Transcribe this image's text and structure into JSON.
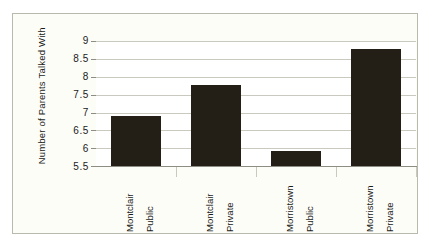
{
  "figure": {
    "background_color": "#ffffff",
    "frame_background_color": "#fdfdf8",
    "frame_border_color": "#b9b9ae",
    "bar_color": "#231f17",
    "grid_color": "#c9c9bf",
    "axis_color": "#8d8d83",
    "text_color": "#1a1a1a"
  },
  "chart_data": {
    "type": "bar",
    "title": "",
    "xlabel": "",
    "ylabel": "Number of Parents Talked With",
    "categories": [
      "Montclair Public",
      "Montclair Private",
      "Morristown Public",
      "Morristown Private"
    ],
    "category_lines": [
      [
        "Montclair",
        "Public"
      ],
      [
        "Montclair",
        "Private"
      ],
      [
        "Morristown",
        "Public"
      ],
      [
        "Morristown",
        "Private"
      ]
    ],
    "values": [
      6.9,
      7.77,
      5.93,
      8.77
    ],
    "ylim": [
      5.5,
      9.0
    ],
    "ytick_labels": [
      "9",
      "8.5",
      "8",
      "7.5",
      "7",
      "6.5",
      "6",
      "5.5"
    ],
    "ytick_values": [
      9,
      8.5,
      8,
      7.5,
      7,
      6.5,
      6,
      5.5
    ],
    "grid": true,
    "grid_axis": "y",
    "legend": false,
    "legend_position": "none",
    "bar_orientation": "vertical"
  }
}
